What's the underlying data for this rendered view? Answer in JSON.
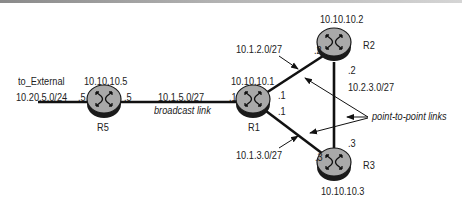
{
  "routers": [
    {
      "name": "R5",
      "loopback": "10.10.10.5"
    },
    {
      "name": "R1",
      "loopback": "10.10.10.1"
    },
    {
      "name": "R2",
      "loopback": "10.10.10.2"
    },
    {
      "name": "R3",
      "loopback": "10.10.10.3"
    }
  ],
  "links": {
    "external": {
      "label": "to_External",
      "subnet": "10.20.5.0/24",
      "r5_if": ".5"
    },
    "r5_r1": {
      "subnet": "10.1.5.0/27",
      "type_label": "broadcast link",
      "r5_if": ".5",
      "r1_if": ".1"
    },
    "r1_r2": {
      "subnet": "10.1.2.0/27",
      "r1_if": ".1",
      "r2_if": ".2"
    },
    "r1_r3": {
      "subnet": "10.1.3.0/27",
      "r1_if": ".1",
      "r3_if": ".3"
    },
    "r2_r3": {
      "subnet": "10.2.3.0/27",
      "r2_if": ".2",
      "r3_if": ".3"
    }
  },
  "annotation": {
    "label": "point-to-point links"
  },
  "colors": {
    "router_fill": "#a9a9a9",
    "router_edge": "#1a1a1a",
    "link": "#111111"
  }
}
